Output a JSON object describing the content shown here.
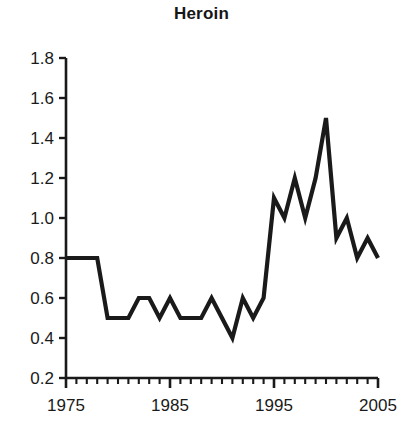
{
  "chart_data": {
    "type": "line",
    "title": "Heroin",
    "xlabel": "",
    "ylabel": "",
    "xlim": [
      1975,
      2005
    ],
    "ylim": [
      0.2,
      1.8
    ],
    "grid": false,
    "legend": null,
    "line_color": "#1a1a1a",
    "background_color": "#ffffff",
    "y_ticks": [
      0.2,
      0.4,
      0.6,
      0.8,
      1.0,
      1.2,
      1.4,
      1.6,
      1.8
    ],
    "y_tick_labels": [
      "0.2",
      "0.4",
      "0.6",
      "0.8",
      "1.0",
      "1.2",
      "1.4",
      "1.6",
      "1.8"
    ],
    "x_ticks_major": [
      1975,
      1985,
      1995,
      2005
    ],
    "x_tick_labels": [
      "1975",
      "1985",
      "1995",
      "2005"
    ],
    "x_ticks_minor_step": 1,
    "x": [
      1975,
      1976,
      1977,
      1978,
      1979,
      1980,
      1981,
      1982,
      1983,
      1984,
      1985,
      1986,
      1987,
      1988,
      1989,
      1990,
      1991,
      1992,
      1993,
      1994,
      1995,
      1996,
      1997,
      1998,
      1999,
      2000,
      2001,
      2002,
      2003,
      2004,
      2005
    ],
    "values": [
      0.8,
      0.8,
      0.8,
      0.8,
      0.5,
      0.5,
      0.5,
      0.6,
      0.6,
      0.5,
      0.6,
      0.5,
      0.5,
      0.5,
      0.6,
      0.5,
      0.4,
      0.6,
      0.5,
      0.6,
      1.1,
      1.0,
      1.2,
      1.0,
      1.2,
      1.5,
      0.9,
      1.0,
      0.8,
      0.9,
      0.8
    ],
    "series": [
      {
        "name": "Heroin",
        "values": [
          0.8,
          0.8,
          0.8,
          0.8,
          0.5,
          0.5,
          0.5,
          0.6,
          0.6,
          0.5,
          0.6,
          0.5,
          0.5,
          0.5,
          0.6,
          0.5,
          0.4,
          0.6,
          0.5,
          0.6,
          1.1,
          1.0,
          1.2,
          1.0,
          1.2,
          1.5,
          0.9,
          1.0,
          0.8,
          0.9,
          0.8
        ]
      }
    ]
  }
}
